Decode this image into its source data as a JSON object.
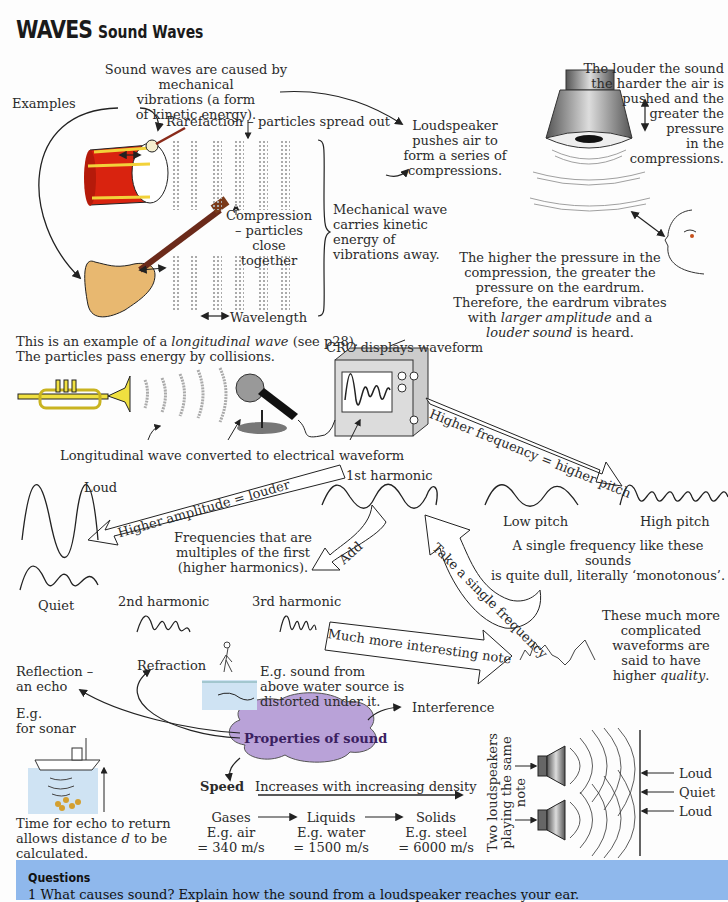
{
  "header": {
    "title": "WAVES",
    "subtitle": "Sound Waves"
  },
  "section1": {
    "caused_by": [
      "Sound waves are caused by mechanical",
      "vibrations (a form",
      "of kinetic energy)."
    ],
    "examples": "Examples",
    "rarefaction": "Rarefaction – particles spread out",
    "compression": [
      "Compression",
      "– particles",
      "close together"
    ],
    "wavelength": "Wavelength",
    "mechanical_wave": [
      "Mechanical wave",
      "carries kinetic",
      "energy of",
      "vibrations away."
    ],
    "loudspeaker": [
      "Loudspeaker",
      "pushes air to",
      "form a series of",
      "compressions."
    ],
    "louder": [
      "The louder the sound",
      "the harder the air is",
      "pushed and the",
      "greater the",
      "pressure",
      "in the",
      "compressions."
    ],
    "eardrum": [
      "The higher the pressure in the",
      "compression, the greater the",
      "pressure on the eardrum.",
      "Therefore, the eardrum vibrates"
    ],
    "eardrum_line5_pre": "with ",
    "eardrum_line5_em": "larger amplitude",
    "eardrum_line5_post": " and a",
    "eardrum_line6_em": "louder sound",
    "eardrum_line6_post": " is heard.",
    "longitudinal_pre": "This is an example of a ",
    "longitudinal_em": "longitudinal wave",
    "longitudinal_post": " (see p28).",
    "collisions": "The particles pass energy by collisions."
  },
  "section2": {
    "cro": "CRO displays waveform",
    "converted": "Longitudinal wave converted to electrical waveform",
    "higher_frequency_arrow": "Higher frequency = higher pitch",
    "higher_amplitude_arrow": "Higher amplitude = louder",
    "loud": "Loud",
    "quiet": "Quiet",
    "first_harmonic": "1st harmonic",
    "low_pitch": "Low pitch",
    "high_pitch": "High pitch",
    "monotonous": [
      "A single frequency like these sounds",
      "is quite dull, literally ‘monotonous’."
    ],
    "multiples": [
      "Frequencies that are",
      "multiples of the first",
      "(higher harmonics)."
    ],
    "add_arrow": "Add",
    "take_single_arrow": "Take a single frequency",
    "second_harmonic": "2nd harmonic",
    "third_harmonic": "3rd harmonic",
    "interesting_arrow": "Much more interesting note",
    "quality": [
      "These much more",
      "complicated",
      "waveforms are",
      "said to have"
    ],
    "quality_last_pre": "higher ",
    "quality_last_em": "quality",
    "quality_last_post": "."
  },
  "section3": {
    "reflection": [
      "Reflection –",
      "an echo"
    ],
    "sonar": [
      "E.g.",
      "for sonar"
    ],
    "refraction": "Refraction",
    "refraction_eg": [
      "E.g. sound from",
      "above water source is",
      "distorted under it."
    ],
    "properties": "Properties of sound",
    "interference": "Interference",
    "echo_time_1": "Time for echo to return",
    "echo_time_2_pre": "allows distance ",
    "echo_time_2_em": "d",
    "echo_time_2_post": " to be",
    "echo_time_3": "calculated.",
    "speed": "Speed",
    "density": "Increases with increasing density",
    "media": [
      {
        "name": "Gases",
        "example": "E.g. air",
        "speed": "= 340 m/s"
      },
      {
        "name": "Liquids",
        "example": "E.g. water",
        "speed": "= 1500 m/s"
      },
      {
        "name": "Solids",
        "example": "E.g. steel",
        "speed": "= 6000 m/s"
      }
    ],
    "two_speakers": [
      "Two loudspeakers",
      "playing the same",
      "note"
    ],
    "interference_labels": [
      "Loud",
      "Quiet",
      "Loud"
    ]
  },
  "questions": {
    "title": "Questions",
    "q1": "1  What causes sound? Explain how the sound from a loudspeaker reaches your ear."
  },
  "colors": {
    "drum_red": "#d9230f",
    "drum_band": "#f2d23a",
    "guitar": "#e8b870",
    "trumpet": "#f0e040",
    "cloud": "#b9a2d8",
    "questions_bg": "#8fb8ec",
    "water": "#cfe3f3"
  }
}
